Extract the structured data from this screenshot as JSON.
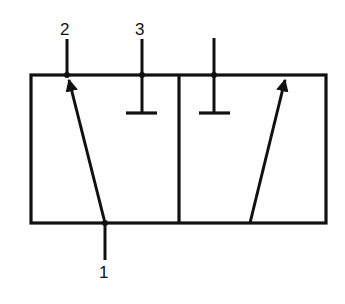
{
  "diagram": {
    "type": "pneumatic-valve-symbol",
    "colors": {
      "line": "#111111",
      "background": "#ffffff"
    },
    "ports": [
      {
        "id": "port-2",
        "label": "2"
      },
      {
        "id": "port-3",
        "label": "3"
      },
      {
        "id": "port-1",
        "label": "1"
      }
    ],
    "positions": [
      {
        "id": "left-position",
        "flow": "1 -> 2 (arrow)",
        "blocked": "3"
      },
      {
        "id": "right-position",
        "flow": "1 -> 2 (arrow)",
        "blocked": "3"
      }
    ]
  }
}
